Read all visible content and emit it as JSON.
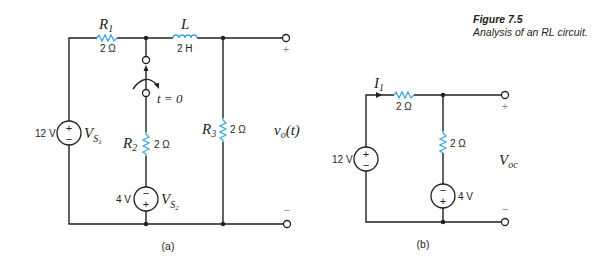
{
  "caption": {
    "title": "Figure 7.5",
    "text": "Analysis of an RL circuit."
  },
  "circuit_a": {
    "label": "(a)",
    "R1": {
      "name": "R",
      "sub": "1",
      "value": "2 Ω"
    },
    "L": {
      "name": "L",
      "value": "2 H"
    },
    "R2": {
      "name": "R",
      "sub": "2",
      "value": "2 Ω"
    },
    "R3": {
      "name": "R",
      "sub": "3",
      "value": "2 Ω"
    },
    "Vs1": {
      "name": "V",
      "sub": "S",
      "subsub": "1",
      "value": "12 V",
      "top": "+",
      "bottom": "−"
    },
    "Vs2": {
      "name": "V",
      "sub": "S",
      "subsub": "2",
      "value": "4 V",
      "top": "−",
      "bottom": "+"
    },
    "switch": {
      "label": "t = 0"
    },
    "output": {
      "name": "v",
      "sub": "o",
      "arg": "(t)",
      "plus": "+",
      "minus": "−"
    }
  },
  "circuit_b": {
    "label": "(b)",
    "current": {
      "name": "I",
      "sub": "1"
    },
    "R_series": {
      "value": "2 Ω"
    },
    "R_shunt": {
      "value": "2 Ω"
    },
    "source_left": {
      "value": "12 V",
      "top": "+",
      "bottom": "−"
    },
    "source_right": {
      "value": "4 V",
      "top": "−",
      "bottom": "+"
    },
    "output": {
      "name": "V",
      "sub": "oc",
      "plus": "+",
      "minus": "−"
    }
  },
  "colors": {
    "wire": "#231f20",
    "component": "#3fa9d6",
    "terminal_sign": "#8a8a8a"
  }
}
